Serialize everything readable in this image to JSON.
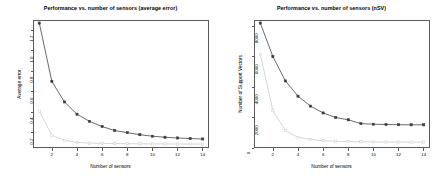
{
  "chart_data": [
    {
      "type": "line",
      "panel": "left",
      "title": "Performance vs. number of sensors (average error)",
      "xlabel": "Number of sensors",
      "ylabel": "Average error",
      "x": [
        1,
        2,
        3,
        4,
        5,
        6,
        7,
        8,
        9,
        10,
        11,
        12,
        13,
        14
      ],
      "xlim": [
        0.5,
        14.5
      ],
      "ylim": [
        0.05,
        1.3
      ],
      "xticks": [
        2,
        4,
        6,
        8,
        10,
        12,
        14
      ],
      "yticks": [
        0.2,
        0.4,
        0.6,
        0.8,
        1.0,
        1.2
      ],
      "ytick_labels": [
        "0.2",
        "0.4",
        "0.6",
        "0.8",
        "1.0",
        "1.2"
      ],
      "xtick_labels": [
        "2",
        "4",
        "6",
        "8",
        "10",
        "12",
        "14"
      ],
      "grid": false,
      "legend": "none",
      "series": [
        {
          "name": "dark-series",
          "color": "#3a3a3a",
          "marker": "filled-square",
          "values": [
            1.27,
            0.7,
            0.5,
            0.38,
            0.31,
            0.26,
            0.22,
            0.2,
            0.18,
            0.165,
            0.155,
            0.148,
            0.142,
            0.138
          ]
        },
        {
          "name": "light-series",
          "color": "#c8c8c8",
          "marker": "open-square",
          "values": [
            0.41,
            0.175,
            0.125,
            0.105,
            0.098,
            0.095,
            0.093,
            0.092,
            0.091,
            0.09,
            0.09,
            0.089,
            0.089,
            0.088
          ]
        }
      ]
    },
    {
      "type": "line",
      "panel": "right",
      "title": "Performance vs. number of sensors (nSV)",
      "xlabel": "Number of sensors",
      "ylabel": "Number of Support Vectors",
      "x": [
        1,
        2,
        3,
        4,
        5,
        6,
        7,
        8,
        9,
        10,
        11,
        12,
        13,
        14
      ],
      "xlim": [
        0.5,
        14.5
      ],
      "ylim": [
        0,
        8400
      ],
      "xticks": [
        2,
        4,
        6,
        8,
        10,
        12,
        14
      ],
      "yticks": [
        0,
        2000,
        4000,
        6000,
        8000
      ],
      "ytick_labels": [
        "0",
        "2000",
        "4000",
        "6000",
        "8000"
      ],
      "xtick_labels": [
        "2",
        "4",
        "6",
        "8",
        "10",
        "12",
        "14"
      ],
      "grid": false,
      "legend": "none",
      "series": [
        {
          "name": "dark-series",
          "color": "#3a3a3a",
          "marker": "filled-square",
          "values": [
            8200,
            6000,
            4400,
            3400,
            2750,
            2300,
            2000,
            1850,
            1600,
            1560,
            1540,
            1530,
            1520,
            1520
          ]
        },
        {
          "name": "light-series",
          "color": "#c8c8c8",
          "marker": "open-square",
          "values": [
            6150,
            2450,
            1150,
            700,
            560,
            480,
            440,
            420,
            410,
            400,
            395,
            390,
            388,
            385
          ]
        }
      ]
    }
  ]
}
